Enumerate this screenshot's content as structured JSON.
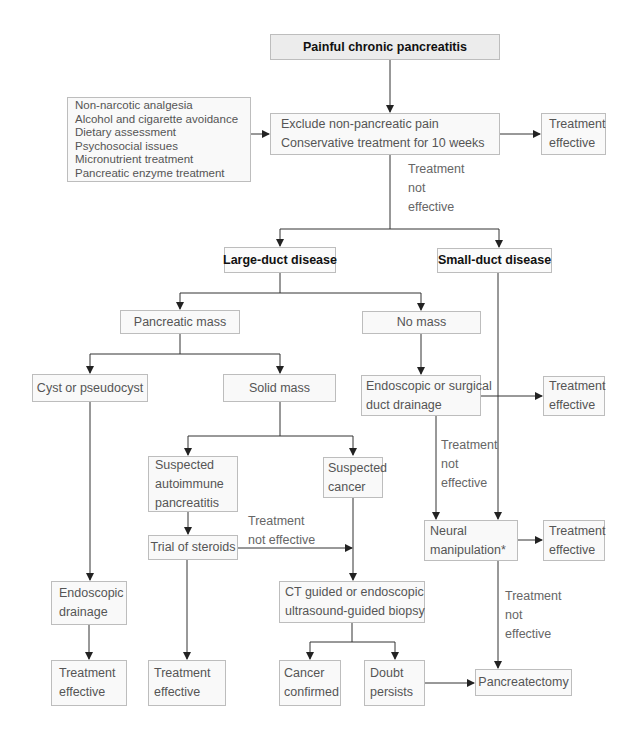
{
  "flowchart": {
    "title": "Painful chronic pancreatitis",
    "conservative_list": [
      "Non-narcotic analgesia",
      "Alcohol and cigarette avoidance",
      "Dietary assessment",
      "Psychosocial issues",
      "Micronutrient treatment",
      "Pancreatic enzyme treatment"
    ],
    "initial_step": [
      "Exclude non-pancreatic pain",
      "Conservative treatment for 10 weeks"
    ],
    "initial_effective": [
      "Treatment",
      "effective"
    ],
    "initial_not_effective": [
      "Treatment",
      "not",
      "effective"
    ],
    "large_duct": "Large-duct disease",
    "small_duct": "Small-duct disease",
    "pancreatic_mass": "Pancreatic mass",
    "no_mass": "No mass",
    "cyst": "Cyst or pseudocyst",
    "solid_mass": "Solid mass",
    "duct_drainage": [
      "Endoscopic or surgical",
      "duct drainage"
    ],
    "duct_drainage_effective": [
      "Treatment",
      "effective"
    ],
    "duct_drainage_not_effective": [
      "Treatment",
      "not",
      "effective"
    ],
    "suspected_autoimmune": [
      "Suspected",
      "autoimmune",
      "pancreatitis"
    ],
    "suspected_cancer": [
      "Suspected",
      "cancer"
    ],
    "trial_steroids": "Trial of steroids",
    "steroids_not_effective": [
      "Treatment",
      "not effective"
    ],
    "neural": [
      "Neural",
      "manipulation*"
    ],
    "neural_effective": [
      "Treatment",
      "effective"
    ],
    "neural_not_effective": [
      "Treatment",
      "not",
      "effective"
    ],
    "endoscopic_drainage": [
      "Endoscopic",
      "drainage"
    ],
    "biopsy": [
      "CT guided or endoscopic",
      "ultrasound-guided biopsy"
    ],
    "cyst_effective": [
      "Treatment",
      "effective"
    ],
    "steroids_effective": [
      "Treatment",
      "effective"
    ],
    "cancer_confirmed": [
      "Cancer",
      "confirmed"
    ],
    "doubt_persists": [
      "Doubt",
      "persists"
    ],
    "pancreatectomy": "Pancreatectomy"
  },
  "colors": {
    "line": "#222222",
    "box_border": "#bdbdbd",
    "title_fill": "#ececec",
    "box_fill": "#f9f9f9",
    "text": "#555555",
    "strong_text": "#111111"
  }
}
